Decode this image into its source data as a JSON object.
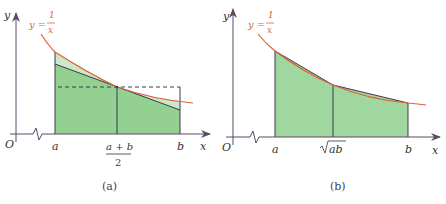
{
  "colors": {
    "axis": "#5a4a66",
    "curve": "#e0603a",
    "fill_dark": "#8fcf8f",
    "fill_light": "#cde8c8",
    "edge": "#3b3b4a"
  },
  "panel_a": {
    "caption": "(a)",
    "y_axis_label": "y",
    "x_axis_label": "x",
    "origin_label": "O",
    "function_label_lhs": "y =",
    "function_numerator": "1",
    "function_denominator": "x",
    "tick_a": "a",
    "tick_mid_numerator": "a + b",
    "tick_mid_denominator": "2",
    "tick_b": "b"
  },
  "panel_b": {
    "caption": "(b)",
    "y_axis_label": "y",
    "x_axis_label": "x",
    "origin_label": "O",
    "function_label_lhs": "y =",
    "function_numerator": "1",
    "function_denominator": "x",
    "tick_a": "a",
    "tick_mid": "ab",
    "tick_b": "b"
  }
}
